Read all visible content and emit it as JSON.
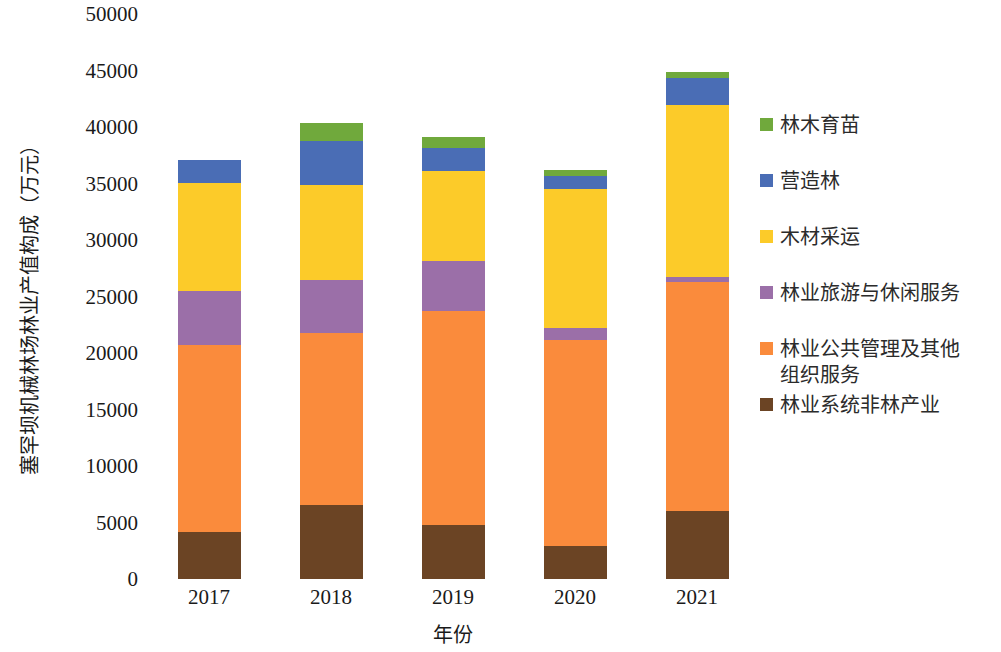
{
  "chart_data": {
    "type": "bar",
    "stacked": true,
    "title": "",
    "xlabel": "年份",
    "ylabel": "塞罕坝机械林场林业产值构成（万元）",
    "categories": [
      "2017",
      "2018",
      "2019",
      "2020",
      "2021"
    ],
    "ylim": [
      0,
      50000
    ],
    "yticks": [
      0,
      5000,
      10000,
      15000,
      20000,
      25000,
      30000,
      35000,
      40000,
      45000,
      50000
    ],
    "ytick_labels": [
      "0",
      "5000",
      "10000",
      "15000",
      "20000",
      "25000",
      "30000",
      "35000",
      "40000",
      "45000",
      "50000"
    ],
    "grid": false,
    "legend_position": "right",
    "series": [
      {
        "name": "林木育苗",
        "color": "#70A93C",
        "values": [
          0,
          1600,
          1000,
          550,
          550
        ]
      },
      {
        "name": "营造林",
        "color": "#4A6DB5",
        "values": [
          2000,
          3850,
          2050,
          1150,
          2350
        ]
      },
      {
        "name": "木材采运",
        "color": "#FCCB29",
        "values": [
          9600,
          8400,
          7950,
          12250,
          15250
        ]
      },
      {
        "name": "林业旅游与休闲服务",
        "color": "#9B6FA8",
        "values": [
          4750,
          4750,
          4400,
          1100,
          450
        ]
      },
      {
        "name": "林业公共管理及其他组织服务",
        "color": "#FA8B3C",
        "values": [
          16500,
          15200,
          19000,
          18250,
          20250
        ]
      },
      {
        "name": "林业系统非林产业",
        "color": "#6B4424",
        "values": [
          4200,
          6550,
          4750,
          2900,
          6000
        ]
      }
    ],
    "totals": [
      37050,
      40350,
      39150,
      36200,
      44850
    ]
  },
  "legend": {
    "items": [
      {
        "label": "林木育苗",
        "color": "#70A93C"
      },
      {
        "label": "营造林",
        "color": "#4A6DB5"
      },
      {
        "label": "木材采运",
        "color": "#FCCB29"
      },
      {
        "label": "林业旅游与休闲服务",
        "color": "#9B6FA8"
      },
      {
        "label": "林业公共管理及其他\n组织服务",
        "color": "#FA8B3C"
      },
      {
        "label": "林业系统非林产业",
        "color": "#6B4424"
      }
    ]
  }
}
